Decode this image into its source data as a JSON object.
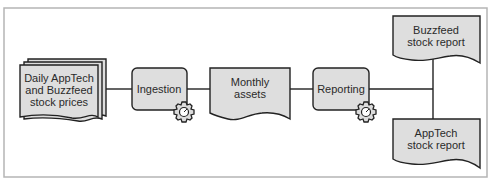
{
  "diagram": {
    "type": "data-pipeline",
    "colors": {
      "shape_fill": "#dedede",
      "stroke": "#222222",
      "frame": "#b5b5b5",
      "background": "#ffffff"
    },
    "nodes": [
      {
        "id": "daily-prices",
        "kind": "multi-document",
        "lines": [
          "Daily AppTech",
          "and Buzzfeed",
          "stock prices"
        ]
      },
      {
        "id": "ingestion",
        "kind": "process",
        "lines": [
          "Ingestion"
        ],
        "icon": "gear-icon"
      },
      {
        "id": "monthly-assets",
        "kind": "document",
        "lines": [
          "Monthly",
          "assets"
        ]
      },
      {
        "id": "reporting",
        "kind": "process",
        "lines": [
          "Reporting"
        ],
        "icon": "gear-icon"
      },
      {
        "id": "buzzfeed-report",
        "kind": "document",
        "lines": [
          "Buzzfeed",
          "stock report"
        ]
      },
      {
        "id": "apptech-report",
        "kind": "document",
        "lines": [
          "AppTech",
          "stock report"
        ]
      }
    ],
    "edges": [
      {
        "from": "daily-prices",
        "to": "ingestion"
      },
      {
        "from": "ingestion",
        "to": "monthly-assets"
      },
      {
        "from": "monthly-assets",
        "to": "reporting"
      },
      {
        "from": "reporting",
        "to": "buzzfeed-report"
      },
      {
        "from": "reporting",
        "to": "apptech-report"
      }
    ]
  }
}
